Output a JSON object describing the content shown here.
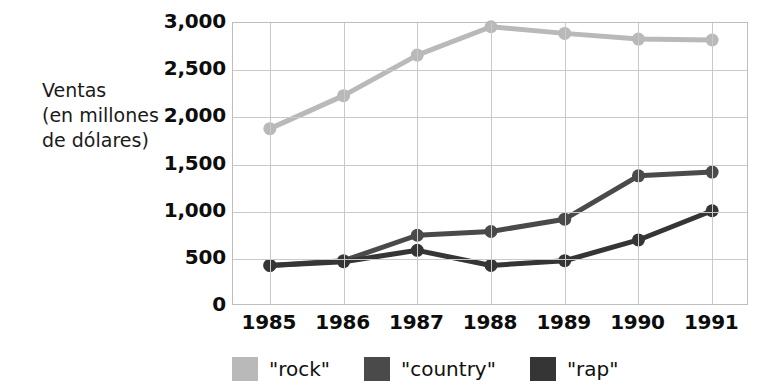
{
  "chart_data": {
    "type": "line",
    "title": "",
    "xlabel": "",
    "ylabel": "Ventas (en millones de dólares)",
    "ylabel_lines": [
      "Ventas",
      "(en millones",
      "de dólares)"
    ],
    "categories": [
      "1985",
      "1986",
      "1987",
      "1988",
      "1989",
      "1990",
      "1991"
    ],
    "ylim": [
      0,
      3000
    ],
    "yticks": [
      0,
      500,
      1000,
      1500,
      2000,
      2500,
      3000
    ],
    "ytick_labels": [
      "0",
      "500",
      "1,000",
      "1,500",
      "2,000",
      "2,500",
      "3,000"
    ],
    "grid": true,
    "legend_position": "bottom",
    "markers": true,
    "series": [
      {
        "name": "\"rock\"",
        "color": "#b9b9b9",
        "values": [
          1880,
          2230,
          2660,
          2960,
          2890,
          2830,
          2820
        ]
      },
      {
        "name": "\"country\"",
        "color": "#4a4a4a",
        "values": [
          430,
          480,
          750,
          790,
          920,
          1380,
          1420
        ]
      },
      {
        "name": "\"rap\"",
        "color": "#353535",
        "values": [
          430,
          470,
          590,
          430,
          480,
          700,
          1010
        ]
      }
    ]
  }
}
